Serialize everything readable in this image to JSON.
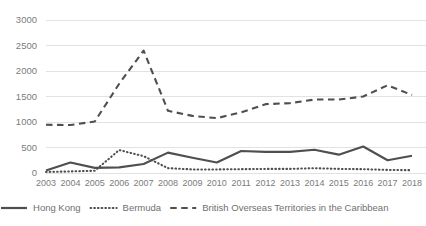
{
  "chart_data": {
    "type": "line",
    "title": "",
    "xlabel": "",
    "ylabel": "",
    "ylim": [
      0,
      3000
    ],
    "ytick_step": 500,
    "grid": true,
    "legend_position": "bottom",
    "categories": [
      "2003",
      "2004",
      "2005",
      "2006",
      "2007",
      "2008",
      "2009",
      "2010",
      "2011",
      "2012",
      "2013",
      "2014",
      "2015",
      "2016",
      "2017",
      "2018"
    ],
    "yticks": [
      "0",
      "500",
      "1000",
      "1500",
      "2000",
      "2500",
      "3000"
    ],
    "series": [
      {
        "name": "Hong Kong",
        "style": "solid",
        "color": "#4f4f4f",
        "values": [
          50,
          205,
          100,
          110,
          175,
          400,
          300,
          205,
          430,
          415,
          415,
          455,
          360,
          520,
          250,
          340
        ]
      },
      {
        "name": "Bermuda",
        "style": "dotted",
        "color": "#4f4f4f",
        "values": [
          20,
          30,
          45,
          450,
          330,
          95,
          70,
          70,
          75,
          80,
          80,
          95,
          80,
          75,
          60,
          55
        ]
      },
      {
        "name": "British Overseas Territories in the Caribbean",
        "style": "dashed",
        "color": "#4f4f4f",
        "values": [
          945,
          940,
          1010,
          1750,
          2400,
          1220,
          1120,
          1075,
          1190,
          1350,
          1370,
          1440,
          1440,
          1500,
          1720,
          1530
        ]
      }
    ]
  },
  "legend": {
    "items": [
      {
        "label": "Hong Kong"
      },
      {
        "label": "Bermuda"
      },
      {
        "label": "British Overseas Territories in the Caribbean"
      }
    ]
  }
}
